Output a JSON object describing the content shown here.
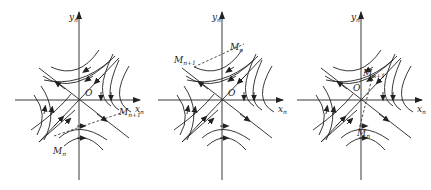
{
  "figure": {
    "colors": {
      "stroke": "#222222",
      "background": "#ffffff"
    },
    "panels": [
      {
        "id": "a",
        "axis_x": "x",
        "axis_x_sub": "n",
        "axis_y": "y",
        "axis_y_sub": "n",
        "origin": "O",
        "point_start": "M",
        "point_start_sub": "n",
        "point_end": "M",
        "point_end_sub": "n+1"
      },
      {
        "id": "b",
        "axis_x": "x",
        "axis_x_sub": "n",
        "axis_y": "y",
        "axis_y_sub": "n",
        "origin": "O",
        "point_start": "M",
        "point_start_sub": "n",
        "point_end": "M",
        "point_end_sub": "n+1"
      },
      {
        "id": "c",
        "axis_x": "x",
        "axis_x_sub": "n",
        "axis_y": "y",
        "axis_y_sub": "n",
        "origin": "O",
        "point_start": "M",
        "point_start_sub": "n",
        "point_end": "M",
        "point_end_sub": "n+1"
      }
    ]
  }
}
